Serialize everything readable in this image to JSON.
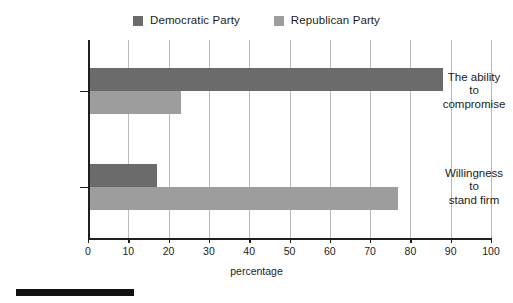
{
  "chart_data": {
    "type": "bar",
    "orientation": "horizontal",
    "title": "",
    "subtitle": "",
    "xlabel": "percentage",
    "ylabel": "",
    "xlim": [
      0,
      100
    ],
    "xticks": [
      0,
      10,
      20,
      30,
      40,
      50,
      60,
      70,
      80,
      90,
      100
    ],
    "xtick_labels": [
      "0",
      "10",
      "20",
      "30",
      "40",
      "50",
      "60",
      "70",
      "80",
      "90",
      "100"
    ],
    "grid": "vertical",
    "legend_position": "top-center",
    "categories": [
      "The ability to compromise",
      "Willingness to stand firm"
    ],
    "category_label_lines": [
      [
        "The ability",
        "to",
        "compromise"
      ],
      [
        "Willingness",
        "to",
        "stand firm"
      ]
    ],
    "series": [
      {
        "name": "Democratic Party",
        "color": "#6b6b6b",
        "values": [
          88,
          17
        ]
      },
      {
        "name": "Republican Party",
        "color": "#9d9d9d",
        "values": [
          23,
          77
        ]
      }
    ]
  },
  "legend": {
    "items": [
      {
        "label": "Democratic Party",
        "color": "#6b6b6b"
      },
      {
        "label": "Republican Party",
        "color": "#9d9d9d"
      }
    ]
  },
  "axis": {
    "x_title": "percentage"
  },
  "footer": {
    "rule": ""
  }
}
